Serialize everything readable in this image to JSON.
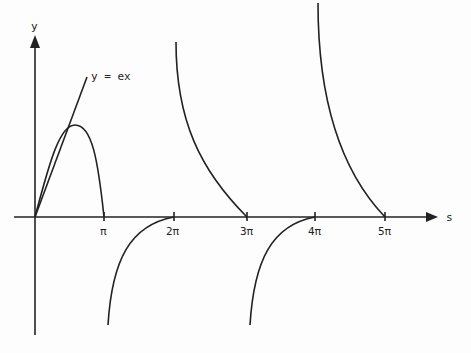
{
  "labels": {
    "y_axis": "y",
    "x_axis": "s",
    "line": "y = ex",
    "ticks": [
      "π",
      "2π",
      "3π",
      "4π",
      "5π"
    ]
  },
  "colors": {
    "ink": "#222222",
    "background": "#fdfdfd"
  }
}
